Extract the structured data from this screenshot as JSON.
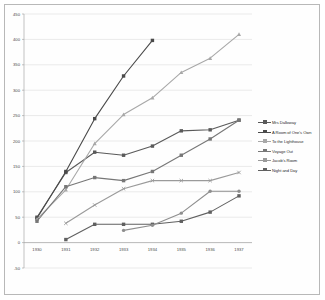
{
  "chart_data": {
    "type": "line",
    "title": "",
    "xlabel": "",
    "ylabel": "",
    "categories": [
      "1930",
      "1931",
      "1932",
      "1933",
      "1934",
      "1935",
      "1936",
      "1937"
    ],
    "ylim": [
      -50,
      450
    ],
    "yticks": [
      -50,
      0,
      50,
      100,
      150,
      200,
      250,
      300,
      350,
      400,
      450
    ],
    "grid": true,
    "legend_position": "right",
    "series": [
      {
        "name": "Mrs Dalloway",
        "color": "#5a5a5a",
        "marker": "square",
        "values": [
          50,
          138,
          178,
          172,
          190,
          220,
          222,
          241
        ]
      },
      {
        "name": "A Room of One's Own",
        "color": "#4a4a4a",
        "marker": "square",
        "values": [
          48,
          140,
          244,
          328,
          398,
          null,
          null,
          null
        ]
      },
      {
        "name": "To the Lighthouse",
        "color": "#a8a8a8",
        "marker": "triangle",
        "values": [
          46,
          104,
          195,
          252,
          285,
          335,
          363,
          410
        ]
      },
      {
        "name": "Voyage Out",
        "color": "#777777",
        "marker": "square",
        "values": [
          42,
          110,
          128,
          122,
          140,
          172,
          204,
          241
        ]
      },
      {
        "name": "Jacob's Room",
        "color": "#9a9a9a",
        "marker": "cross",
        "values": [
          null,
          38,
          74,
          106,
          122,
          122,
          122,
          138
        ]
      },
      {
        "name": "Night and Day",
        "color": "#606060",
        "marker": "square",
        "values": [
          null,
          6,
          36,
          36,
          36,
          42,
          60,
          92
        ]
      },
      {
        "name": "Night and Day upper",
        "color": "#8e8e8e",
        "marker": "circle",
        "values": [
          null,
          null,
          null,
          24,
          34,
          58,
          101,
          101
        ]
      }
    ]
  },
  "axes": {
    "y_tick_labels": [
      "450",
      "400",
      "350",
      "300",
      "250",
      "200",
      "150",
      "100",
      "50",
      "0",
      "-50"
    ],
    "x_tick_labels": [
      "1930",
      "1931",
      "1932",
      "1933",
      "1934",
      "1935",
      "1936",
      "1937"
    ]
  },
  "legend": {
    "items": [
      {
        "label": "Mrs Dalloway",
        "color": "#5a5a5a"
      },
      {
        "label": "A Room of One's Own",
        "color": "#4a4a4a"
      },
      {
        "label": "To the Lighthouse",
        "color": "#a8a8a8"
      },
      {
        "label": "Voyage Out",
        "color": "#777777"
      },
      {
        "label": "Jacob's Room",
        "color": "#9a9a9a"
      },
      {
        "label": "Night and Day",
        "color": "#606060"
      }
    ]
  }
}
